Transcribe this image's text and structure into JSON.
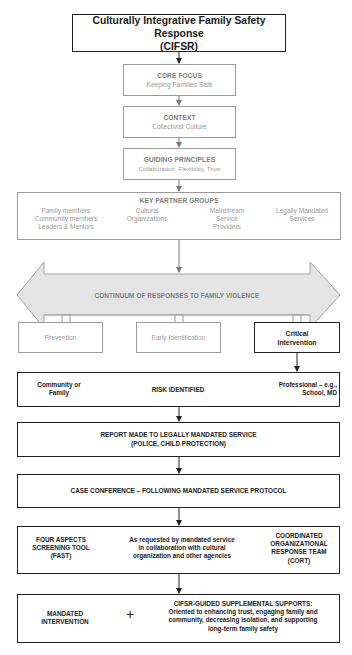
{
  "title": {
    "line1": "Culturally Integrative Family Safety Response",
    "line2": "(CIFSR)"
  },
  "core_focus": {
    "heading": "CORE FOCUS",
    "text": "Keeping Families Safe"
  },
  "context": {
    "heading": "CONTEXT",
    "text": "Collectivist Culture"
  },
  "guiding_principles": {
    "heading": "GUIDING PRINCIPLES",
    "text": "Collaboration, Flexibility, Trust"
  },
  "key_partners": {
    "heading": "KEY PARTNER GROUPS",
    "groups": [
      {
        "lines": [
          "Family members",
          "Community members",
          "Leaders & Mentors"
        ]
      },
      {
        "lines": [
          "Cultural",
          "Organizations"
        ]
      },
      {
        "lines": [
          "Mainstream",
          "Service",
          "Providers"
        ]
      },
      {
        "lines": [
          "Legally Mandated",
          "Services"
        ]
      }
    ]
  },
  "continuum": {
    "label": "CONTINUUM OF RESPONSES TO FAMILY VIOLENCE"
  },
  "responses": [
    {
      "label": "Prevention"
    },
    {
      "label": "Early Identification"
    },
    {
      "line1": "Critical",
      "line2": "Intervention"
    }
  ],
  "risk": {
    "left_line1": "Community or",
    "left_line2": "Family",
    "center": "RISK IDENTIFIED",
    "right_line1": "Professional – e.g.,",
    "right_line2": "School, MD"
  },
  "report": {
    "line1": "REPORT MADE TO LEGALLY MANDATED SERVICE",
    "line2": "(POLICE, CHILD PROTECTION)"
  },
  "case_conference": {
    "text": "CASE CONFERENCE – FOLLOWING MANDATED SERVICE PROTOCOL"
  },
  "tools": {
    "left": [
      "FOUR ASPECTS",
      "SCREENING TOOL",
      "(FAST)"
    ],
    "center": [
      "As requested by mandated service",
      "in collaboration with cultural",
      "organization and other agencies"
    ],
    "right": [
      "COORDINATED",
      "ORGANIZATIONAL",
      "RESPONSE TEAM",
      "(CORT)"
    ]
  },
  "outcome": {
    "left": [
      "MANDATED",
      "INTERVENTION"
    ],
    "plus": "+",
    "right_heading": "CIFSR-GUIDED SUPPLEMENTAL SUPPORTS:",
    "right_lines": [
      "Oriented to enhancing trust, engaging family and",
      "community, decreasing isolation, and supporting",
      "long-term family safety"
    ]
  },
  "colors": {
    "dark_line": "#222222",
    "light_line": "#9a9a9a",
    "band_fill": "#e4e4e4",
    "band_stroke": "#a5a5a5"
  }
}
